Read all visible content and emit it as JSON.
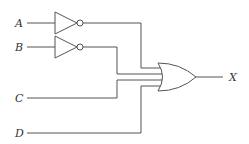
{
  "diagram": {
    "type": "logic-circuit",
    "inputs": [
      {
        "label": "A",
        "inverted": true
      },
      {
        "label": "B",
        "inverted": true
      },
      {
        "label": "C",
        "inverted": false
      },
      {
        "label": "D",
        "inverted": false
      }
    ],
    "gate": {
      "type": "OR",
      "input_count": 4
    },
    "output": {
      "label": "X"
    },
    "expression": "X = A' + B' + C + D"
  }
}
